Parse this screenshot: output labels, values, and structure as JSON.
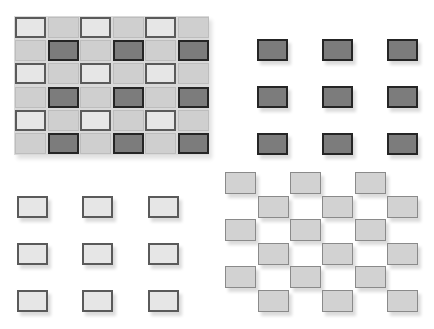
{
  "colors": {
    "light_fill": "#e6e6e6",
    "light_border": "#5a5a5a",
    "medium_fill": "#cfcfcf",
    "medium_border": "#bdbdbd",
    "dark_fill": "#7c7c7c",
    "dark_border": "#252525",
    "stagger_fill": "#d2d2d2",
    "stagger_border": "#8a8a8a",
    "background": "#ffffff"
  },
  "panels": {
    "checker_grid": {
      "rows": 6,
      "cols": 6,
      "origin": [
        14,
        16
      ],
      "cell": [
        32.5,
        23.2
      ],
      "pattern": [
        [
          "L",
          "M",
          "L",
          "M",
          "L",
          "M"
        ],
        [
          "M",
          "D",
          "M",
          "D",
          "M",
          "D"
        ],
        [
          "L",
          "M",
          "L",
          "M",
          "L",
          "M"
        ],
        [
          "M",
          "D",
          "M",
          "D",
          "M",
          "D"
        ],
        [
          "L",
          "M",
          "L",
          "M",
          "L",
          "M"
        ],
        [
          "M",
          "D",
          "M",
          "D",
          "M",
          "D"
        ]
      ]
    },
    "dark_grid": {
      "rows": 3,
      "cols": 3,
      "xs": [
        257,
        322,
        387
      ],
      "ys": [
        39,
        86,
        133
      ],
      "size": [
        31,
        22
      ]
    },
    "light_grid": {
      "rows": 3,
      "cols": 3,
      "xs": [
        17,
        82,
        148
      ],
      "ys": [
        196,
        243,
        290
      ],
      "size": [
        31,
        22
      ]
    },
    "staggered_grid": {
      "rows": 6,
      "even_xs": [
        225,
        290,
        355
      ],
      "odd_xs": [
        258,
        322,
        387
      ],
      "ys": [
        172,
        196,
        219,
        243,
        266,
        290
      ],
      "size": [
        31,
        22
      ]
    }
  }
}
